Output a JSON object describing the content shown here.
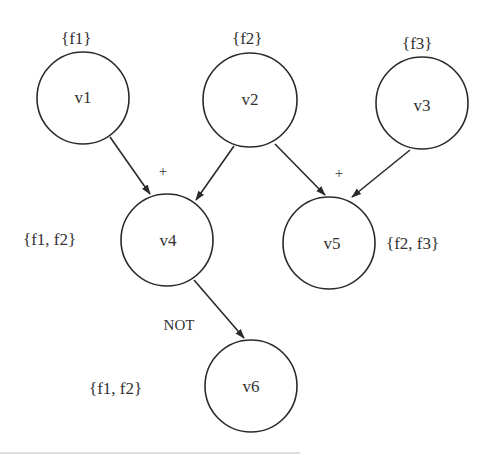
{
  "diagram": {
    "nodes": [
      {
        "id": "v1",
        "label": "v1",
        "set": "{f1}"
      },
      {
        "id": "v2",
        "label": "v2",
        "set": "{f2}"
      },
      {
        "id": "v3",
        "label": "v3",
        "set": "{f3}"
      },
      {
        "id": "v4",
        "label": "v4",
        "set": "{f1, f2}"
      },
      {
        "id": "v5",
        "label": "v5",
        "set": "{f2, f3}"
      },
      {
        "id": "v6",
        "label": "v6",
        "set": "{f1, f2}"
      }
    ],
    "edges": [
      {
        "from": "v1",
        "to": "v4"
      },
      {
        "from": "v2",
        "to": "v4"
      },
      {
        "from": "v2",
        "to": "v5"
      },
      {
        "from": "v3",
        "to": "v5"
      },
      {
        "from": "v4",
        "to": "v6"
      }
    ],
    "operators": [
      {
        "target": "v4",
        "label": "+"
      },
      {
        "target": "v5",
        "label": "+"
      },
      {
        "target": "v6",
        "label": "NOT"
      }
    ]
  }
}
